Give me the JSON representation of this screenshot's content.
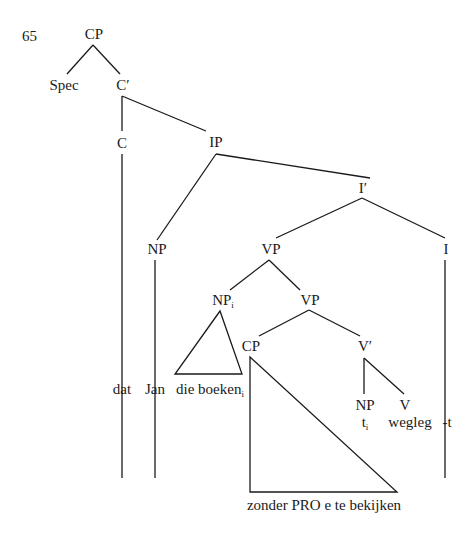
{
  "example_number": "65",
  "nodes": {
    "cp_root": "CP",
    "spec": "Spec",
    "c_bar": "C′",
    "c": "C",
    "ip": "IP",
    "i_bar": "I′",
    "np_subj": "NP",
    "vp_upper": "VP",
    "i": "I",
    "np_i": "NP",
    "np_i_index": "i",
    "vp_lower": "VP",
    "cp_adjunct": "CP",
    "v_bar": "V′",
    "np_trace": "NP",
    "v": "V"
  },
  "leaves": {
    "dat": "dat",
    "jan": "Jan",
    "die_boeken": "die boeken",
    "die_boeken_index": "i",
    "trace": "t",
    "trace_index": "i",
    "wegleg": "wegleg",
    "affix": "-t",
    "cp_content": "zonder PRO e te bekijken"
  }
}
